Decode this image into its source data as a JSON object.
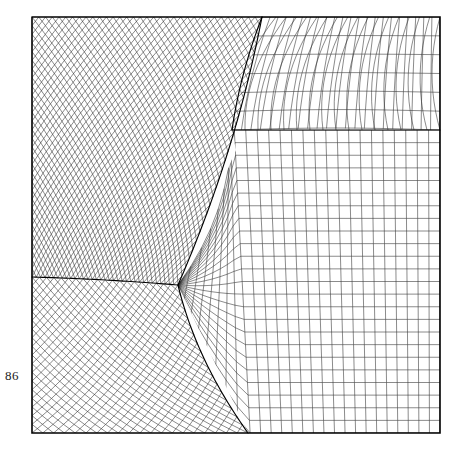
{
  "document": {
    "page_number": "86",
    "background_color": "#ffffff"
  },
  "figure": {
    "name": "multi-block-structured-mesh",
    "type": "computational-grid-diagram",
    "line_color": "#2a2a2a",
    "frame_color": "#000000",
    "frame_width_px": 1.6,
    "mesh_line_width_px": 0.55,
    "interface_line_width_px": 1.15,
    "frame": {
      "x0": 32,
      "y0": 17,
      "x1": 440,
      "y1": 433
    },
    "blocks": [
      {
        "id": "upper-left-diagonal",
        "label": "upper left diagonal block",
        "orientation_deg": 45,
        "nu": 34,
        "nv": 30,
        "corners": [
          [
            32,
            17
          ],
          [
            262,
            17
          ],
          [
            178,
            285
          ],
          [
            32,
            277
          ]
        ]
      },
      {
        "id": "lower-left-diagonal",
        "label": "lower left diagonal block",
        "orientation_deg": 45,
        "nu": 20,
        "nv": 18,
        "corners": [
          [
            32,
            277
          ],
          [
            178,
            285
          ],
          [
            248,
            433
          ],
          [
            32,
            433
          ]
        ]
      },
      {
        "id": "central-curvilinear",
        "label": "central curvilinear block",
        "orientation_deg": 0,
        "nu": 26,
        "nv": 24,
        "corners": [
          [
            178,
            285
          ],
          [
            232,
            130
          ],
          [
            440,
            130
          ],
          [
            440,
            433
          ],
          [
            248,
            433
          ]
        ]
      },
      {
        "id": "upper-band",
        "label": "upper curved band block",
        "orientation_deg": 0,
        "nu": 22,
        "nv": 6,
        "corners": [
          [
            262,
            17
          ],
          [
            440,
            17
          ],
          [
            440,
            130
          ],
          [
            232,
            130
          ]
        ]
      }
    ],
    "interfaces": [
      {
        "id": "if-left-horizontal",
        "from": [
          32,
          277
        ],
        "to": [
          178,
          285
        ]
      },
      {
        "id": "if-diagonal-upper",
        "from": [
          178,
          285
        ],
        "to": [
          262,
          17
        ]
      },
      {
        "id": "if-diagonal-lower",
        "from": [
          178,
          285
        ],
        "to": [
          248,
          433
        ]
      },
      {
        "id": "if-band-lower",
        "from": [
          232,
          130
        ],
        "to": [
          440,
          130
        ]
      },
      {
        "id": "if-band-left",
        "from": [
          232,
          130
        ],
        "to": [
          262,
          17
        ]
      }
    ]
  }
}
